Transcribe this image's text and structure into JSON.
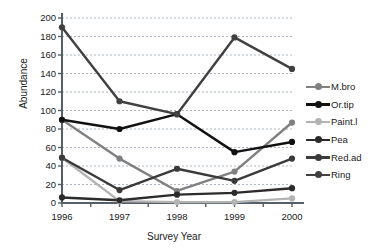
{
  "chart_data": {
    "type": "line",
    "title": "",
    "xlabel": "Survey Year",
    "ylabel": "Abundance",
    "categories": [
      "1996",
      "1997",
      "1998",
      "1999",
      "2000"
    ],
    "x": [
      1996,
      1997,
      1998,
      1999,
      2000
    ],
    "xlim": [
      1996,
      2000
    ],
    "ylim": [
      0,
      200
    ],
    "yticks": [
      0,
      20,
      40,
      60,
      80,
      100,
      120,
      140,
      160,
      180,
      200
    ],
    "ytick_labels": [
      "0",
      "20",
      "40",
      "60",
      "80",
      "100",
      "120",
      "140",
      "160",
      "180",
      "200"
    ],
    "grid": "horizontal-dashed",
    "legend_position": "right",
    "marker": "circle",
    "series": [
      {
        "name": "M.bro",
        "color": "#808080",
        "values": [
          90,
          48,
          13,
          34,
          87
        ]
      },
      {
        "name": "Or.tip",
        "color": "#111111",
        "values": [
          90,
          80,
          96,
          55,
          66
        ]
      },
      {
        "name": "Paint.l",
        "color": "#b3b3b3",
        "values": [
          49,
          2,
          1,
          1,
          5
        ]
      },
      {
        "name": "Pea",
        "color": "#2b2b2b",
        "values": [
          6,
          3,
          9,
          11,
          16
        ]
      },
      {
        "name": "Red.ad",
        "color": "#3a3a3a",
        "values": [
          49,
          14,
          37,
          24,
          48
        ]
      },
      {
        "name": "Ring",
        "color": "#404040",
        "values": [
          190,
          110,
          96,
          179,
          145
        ]
      }
    ]
  },
  "legend": {
    "items": [
      {
        "label": "M.bro"
      },
      {
        "label": "Or.tip"
      },
      {
        "label": "Paint.l"
      },
      {
        "label": "Pea"
      },
      {
        "label": "Red.ad"
      },
      {
        "label": "Ring"
      }
    ]
  },
  "axes": {
    "y_title": "Abundance",
    "x_title": "Survey Year"
  }
}
